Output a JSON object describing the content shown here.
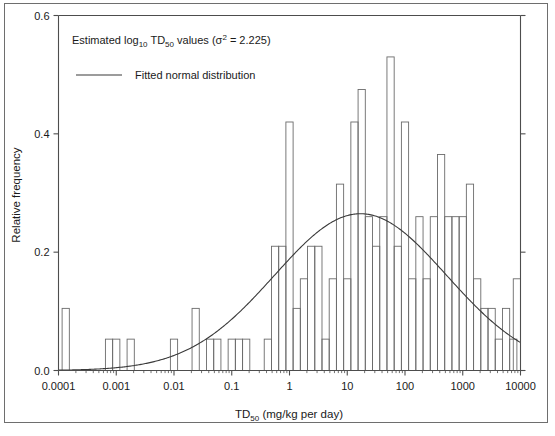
{
  "chart_data": {
    "type": "bar",
    "title": "",
    "annotations": [
      {
        "name": "variance-note",
        "text": "Estimated log₁₀ TD₅₀ values (σ² = 2.225)"
      }
    ],
    "legend": {
      "position": "top-left",
      "entries": [
        {
          "label": "Fitted normal distribution",
          "marker": "line",
          "color": "#333333"
        }
      ]
    },
    "xlabel": "TD₅₀ (mg/kg per day)",
    "ylabel": "Relative frequency",
    "xscale": "log",
    "xlim": [
      0.0001,
      10000
    ],
    "ylim": [
      0.0,
      0.6
    ],
    "grid": false,
    "xtick_labels": [
      "0.0001",
      "0.001",
      "0.01",
      "0.1",
      "1",
      "10",
      "100",
      "1000",
      "10000"
    ],
    "xtick_values": [
      0.0001,
      0.001,
      0.01,
      0.1,
      1,
      10,
      100,
      1000,
      10000
    ],
    "ytick_labels": [
      "0.0",
      "0.2",
      "0.4",
      "0.6"
    ],
    "ytick_values": [
      0.0,
      0.2,
      0.4,
      0.6
    ],
    "bar_width_decades": 0.125,
    "bars": [
      {
        "x_log10": -3.875,
        "value": 0.105
      },
      {
        "x_log10": -3.125,
        "value": 0.053
      },
      {
        "x_log10": -3.0,
        "value": 0.053
      },
      {
        "x_log10": -2.75,
        "value": 0.053
      },
      {
        "x_log10": -2.0,
        "value": 0.053
      },
      {
        "x_log10": -1.625,
        "value": 0.105
      },
      {
        "x_log10": -1.375,
        "value": 0.053
      },
      {
        "x_log10": -1.25,
        "value": 0.053
      },
      {
        "x_log10": -1.0,
        "value": 0.053
      },
      {
        "x_log10": -0.875,
        "value": 0.053
      },
      {
        "x_log10": -0.75,
        "value": 0.053
      },
      {
        "x_log10": -0.375,
        "value": 0.053
      },
      {
        "x_log10": -0.25,
        "value": 0.21
      },
      {
        "x_log10": -0.125,
        "value": 0.21
      },
      {
        "x_log10": 0.0,
        "value": 0.42
      },
      {
        "x_log10": 0.125,
        "value": 0.105
      },
      {
        "x_log10": 0.25,
        "value": 0.155
      },
      {
        "x_log10": 0.375,
        "value": 0.21
      },
      {
        "x_log10": 0.5,
        "value": 0.21
      },
      {
        "x_log10": 0.625,
        "value": 0.053
      },
      {
        "x_log10": 0.75,
        "value": 0.155
      },
      {
        "x_log10": 0.875,
        "value": 0.315
      },
      {
        "x_log10": 1.0,
        "value": 0.155
      },
      {
        "x_log10": 1.125,
        "value": 0.42
      },
      {
        "x_log10": 1.25,
        "value": 0.475
      },
      {
        "x_log10": 1.375,
        "value": 0.26
      },
      {
        "x_log10": 1.5,
        "value": 0.21
      },
      {
        "x_log10": 1.625,
        "value": 0.26
      },
      {
        "x_log10": 1.75,
        "value": 0.53
      },
      {
        "x_log10": 1.875,
        "value": 0.21
      },
      {
        "x_log10": 2.0,
        "value": 0.42
      },
      {
        "x_log10": 2.125,
        "value": 0.155
      },
      {
        "x_log10": 2.25,
        "value": 0.26
      },
      {
        "x_log10": 2.375,
        "value": 0.155
      },
      {
        "x_log10": 2.5,
        "value": 0.26
      },
      {
        "x_log10": 2.625,
        "value": 0.365
      },
      {
        "x_log10": 2.75,
        "value": 0.26
      },
      {
        "x_log10": 2.875,
        "value": 0.26
      },
      {
        "x_log10": 3.0,
        "value": 0.26
      },
      {
        "x_log10": 3.125,
        "value": 0.315
      },
      {
        "x_log10": 3.25,
        "value": 0.155
      },
      {
        "x_log10": 3.375,
        "value": 0.105
      },
      {
        "x_log10": 3.5,
        "value": 0.105
      },
      {
        "x_log10": 3.625,
        "value": 0.053
      },
      {
        "x_log10": 3.75,
        "value": 0.105
      },
      {
        "x_log10": 3.875,
        "value": 0.053
      },
      {
        "x_log10": 3.9375,
        "value": 0.155
      }
    ],
    "fitted_curve": {
      "name": "Fitted normal distribution",
      "mean_log10": 1.23,
      "variance_log10": 2.225,
      "peak_value": 0.265,
      "scale": 1.0
    }
  },
  "axes": {
    "ylabel": "Relative frequency",
    "xlabel_parts": {
      "pre": "TD",
      "sub": "50",
      "post": " (mg/kg per day)"
    }
  },
  "legend_text": {
    "note_pre": "Estimated log",
    "note_sub": "10",
    "note_mid": " TD",
    "note_sub2": "50",
    "note_post_pre": " values (σ",
    "note_sup": "2",
    "note_post": " = 2.225)",
    "fit_label": "Fitted normal distribution"
  },
  "colors": {
    "axis": "#4d4d4d",
    "bar_stroke": "#6b6b6b",
    "curve": "#3a3a3a",
    "text": "#1a1a1a",
    "outer_border": "#6e6e6e",
    "background": "#ffffff"
  }
}
